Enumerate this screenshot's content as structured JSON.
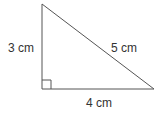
{
  "diagram": {
    "type": "right-triangle",
    "stroke_color": "#555555",
    "sides": {
      "vertical": "3 cm",
      "hypotenuse": "5 cm",
      "horizontal": "4 cm"
    },
    "right_angle_marker": true
  }
}
